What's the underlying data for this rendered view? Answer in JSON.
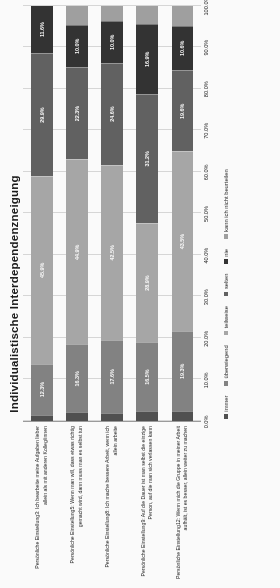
{
  "chart_data": {
    "type": "bar",
    "subtype": "100% stacked horizontal bar",
    "title": "Individualistische Interdependenzneigung",
    "xlabel": "",
    "ylabel": "",
    "xlim": [
      0,
      100
    ],
    "grid": true,
    "legend_position": "bottom",
    "xticks": [
      "0.0%",
      "10.0%",
      "20.0%",
      "30.0%",
      "40.0%",
      "50.0%",
      "60.0%",
      "70.0%",
      "80.0%",
      "90.0%",
      "100.0%"
    ],
    "xtick_values": [
      0,
      10,
      20,
      30,
      40,
      50,
      60,
      70,
      80,
      90,
      100
    ],
    "categories": [
      "Persönliche Einstellung3: Ich bearbeite meine Aufgaben lieber allein als mit anderen Kolleg/innen",
      "Persönliche Einstellung5: Wenn man will, dass etwas richtig gemacht wird, dann muss man es selbst tun",
      "Persönliche Einstellung8: Ich mache bessere Arbeit, wenn ich allein arbeite",
      "Persönliche Einstellung9: Auf die Dauer ist man selbst die einzige Person, auf die man sich verlassen kann",
      "Persönliche Einstellung12: Wenn mich die Gruppe in meiner Arbeit aufhält, ist es besser, allein weiter zu machen"
    ],
    "series": [
      {
        "name": "immer",
        "color": "#4a4a4a",
        "values": [
          1.3,
          1.9,
          1.7,
          2.2,
          2.2
        ]
      },
      {
        "name": "überwiegend",
        "color": "#7f7f7f",
        "values": [
          12.3,
          16.3,
          17.6,
          16.5,
          19.3
        ]
      },
      {
        "name": "teilweise",
        "color": "#a6a6a6",
        "values": [
          45.9,
          44.9,
          42.5,
          28.9,
          43.5
        ]
      },
      {
        "name": "selten",
        "color": "#5c5c5c",
        "values": [
          29.9,
          22.3,
          24.6,
          31.2,
          19.6
        ]
      },
      {
        "name": "nie",
        "color": "#2b2b2b",
        "values": [
          11.6,
          10.0,
          10.0,
          16.9,
          10.6
        ]
      },
      {
        "name": "kann ich nicht beurteilen",
        "color": "#9e9e9e",
        "values": [
          0.0,
          4.6,
          3.6,
          4.3,
          4.8
        ]
      }
    ],
    "bar_labels": [
      [
        "",
        "12.3%",
        "45.9%",
        "29.9%",
        "11.6%",
        ""
      ],
      [
        "",
        "16.3%",
        "44.9%",
        "22.3%",
        "10.0%",
        ""
      ],
      [
        "",
        "17.6%",
        "42.5%",
        "24.6%",
        "10.0%",
        ""
      ],
      [
        "",
        "16.5%",
        "28.9%",
        "31.2%",
        "16.9%",
        ""
      ],
      [
        "",
        "19.3%",
        "43.5%",
        "19.6%",
        "10.6%",
        ""
      ]
    ],
    "legend": [
      {
        "label": "immer",
        "color": "#4a4a4a"
      },
      {
        "label": "überwiegend",
        "color": "#7f7f7f"
      },
      {
        "label": "teilweise",
        "color": "#a6a6a6"
      },
      {
        "label": "selten",
        "color": "#5c5c5c"
      },
      {
        "label": "nie",
        "color": "#2b2b2b"
      },
      {
        "label": "kann ich nicht beurteilen",
        "color": "#9e9e9e"
      }
    ]
  }
}
